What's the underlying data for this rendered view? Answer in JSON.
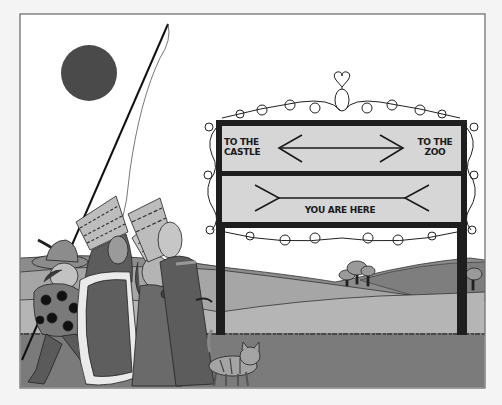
{
  "illustration": {
    "subject": "Müller-Lyer illusion signpost scene",
    "sign": {
      "top_panel": {
        "left_label": [
          "TO THE",
          "CASTLE"
        ],
        "right_label": [
          "TO THE",
          "ZOO"
        ],
        "arrow": "double-headed outward arrow"
      },
      "bottom_panel": {
        "label": "YOU ARE HERE",
        "arrow": "line with inward fins"
      }
    },
    "elements": [
      "sun",
      "lance-with-pennant",
      "boy-with-feathered-hat",
      "king-with-crown",
      "girl-with-flowers",
      "queen-with-crown",
      "striped-cat",
      "trees",
      "rolling-hills",
      "ornate-iron-signpost"
    ]
  },
  "colors": {
    "sky": "#ffffff",
    "border": "#666666",
    "sun": "#4a4a4a",
    "sign_panel": "#d6d6d6",
    "sign_frame": "#1e1e1e",
    "hill_far": "#8a8a8a",
    "hill_mid": "#a8a8a8",
    "hill_near": "#b4b4b4",
    "ground": "#7a7a7a"
  }
}
